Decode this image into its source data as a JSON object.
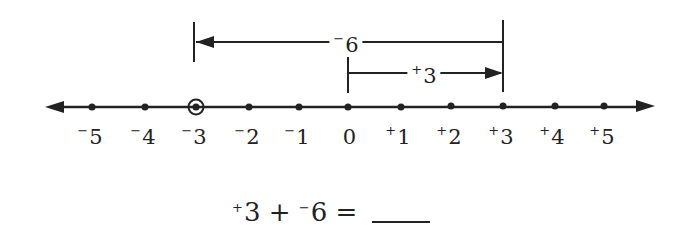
{
  "number_line": {
    "min": -5,
    "max": 5,
    "ticks": [
      {
        "value": -5,
        "sign": "−",
        "num": "5",
        "x": 92
      },
      {
        "value": -4,
        "sign": "−",
        "num": "4",
        "x": 145
      },
      {
        "value": -3,
        "sign": "−",
        "num": "3",
        "x": 196
      },
      {
        "value": -2,
        "sign": "−",
        "num": "2",
        "x": 249
      },
      {
        "value": -1,
        "sign": "−",
        "num": "1",
        "x": 299
      },
      {
        "value": 0,
        "sign": "",
        "num": "0",
        "x": 348
      },
      {
        "value": 1,
        "sign": "+",
        "num": "1",
        "x": 401
      },
      {
        "value": 2,
        "sign": "+",
        "num": "2",
        "x": 451
      },
      {
        "value": 3,
        "sign": "+",
        "num": "3",
        "x": 503
      },
      {
        "value": 4,
        "sign": "+",
        "num": "4",
        "x": 555
      },
      {
        "value": 5,
        "sign": "+",
        "num": "5",
        "x": 604
      }
    ],
    "circled_value": -3
  },
  "arrows": {
    "first": {
      "sign": "+",
      "num": "3",
      "from": 0,
      "to": 3
    },
    "second": {
      "sign": "−",
      "num": "6",
      "from": 3,
      "to": -3
    }
  },
  "equation": {
    "a_sign": "+",
    "a_num": "3",
    "op": "+",
    "b_sign": "−",
    "b_num": "6",
    "equals": "="
  },
  "colors": {
    "ink": "#222222",
    "background": "#ffffff"
  }
}
